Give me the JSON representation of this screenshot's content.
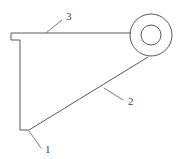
{
  "drawing": {
    "title": "Bracket part outline with circular boss",
    "background_color": "#ffffff",
    "line_color": "#5a5a5a",
    "leader_color": "#6e6e6e",
    "text_color": "#4a4a4a",
    "canvas": {
      "width": 186,
      "height": 159
    }
  },
  "geometry": {
    "outline_path": "M 10 33 L 130 33 L 130 34 L 10 34 Z",
    "part_profile": "M 11 33 L 129 33 M 11 33 L 11 40 L 20 40 L 20 130 L 29 130 L 148 57",
    "boss": {
      "center_x": 151,
      "center_y": 35,
      "outer_radius": 21,
      "inner_radius": 10
    },
    "notch": {
      "x": 11,
      "y_top": 33,
      "y_bottom": 40,
      "x_right": 20
    },
    "bottom_step": {
      "x_left": 20,
      "y": 130,
      "x_right": 29
    },
    "diagonal": {
      "x1": 29,
      "y1": 130,
      "x2": 148,
      "y2": 57
    }
  },
  "callouts": [
    {
      "id": "callout-1",
      "label": "1",
      "text_x": 45,
      "text_y": 150,
      "leader_x1": 29,
      "leader_y1": 131,
      "leader_x2": 41,
      "leader_y2": 148
    },
    {
      "id": "callout-2",
      "label": "2",
      "text_x": 128,
      "text_y": 102,
      "leader_x1": 104,
      "leader_y1": 88,
      "leader_x2": 123,
      "leader_y2": 100
    },
    {
      "id": "callout-3",
      "label": "3",
      "text_x": 66,
      "text_y": 17,
      "leader_x1": 46,
      "leader_y1": 33,
      "leader_x2": 62,
      "leader_y2": 20
    }
  ]
}
